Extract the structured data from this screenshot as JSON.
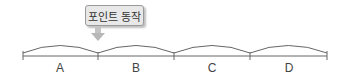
{
  "callout": {
    "label": "포인트 동작"
  },
  "segments": [
    {
      "label": "A"
    },
    {
      "label": "B"
    },
    {
      "label": "C"
    },
    {
      "label": "D"
    }
  ],
  "colors": {
    "line": "#666666",
    "arrow": "#bdbdbd",
    "box": "#e8e8e8"
  }
}
